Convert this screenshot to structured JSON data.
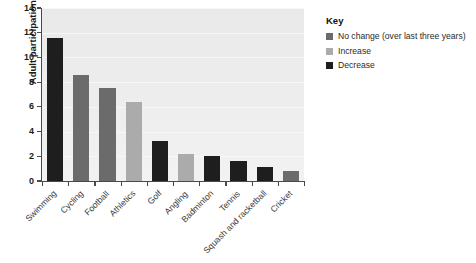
{
  "chart_data": {
    "type": "bar",
    "title": "",
    "xlabel": "",
    "ylabel": "Adult participation per month (%)",
    "ylim": [
      0,
      14
    ],
    "yticks": [
      0,
      2,
      4,
      6,
      8,
      10,
      12,
      14
    ],
    "grid": true,
    "legend_position": "right",
    "categories": [
      "Swimming",
      "Cycling",
      "Football",
      "Athletics",
      "Golf",
      "Angling",
      "Badminton",
      "Tennis",
      "Squash and racketball",
      "Cricket"
    ],
    "values": [
      11.6,
      8.6,
      7.5,
      6.4,
      3.2,
      2.2,
      2.0,
      1.6,
      1.1,
      0.85
    ],
    "point_categories": [
      "Decrease",
      "No change",
      "No change",
      "Increase",
      "Decrease",
      "Increase",
      "Decrease",
      "Decrease",
      "Decrease",
      "No change"
    ],
    "series": [
      {
        "name": "Adult participation per month (%)",
        "values": [
          11.6,
          8.6,
          7.5,
          6.4,
          3.2,
          2.2,
          2.0,
          1.6,
          1.1,
          0.85
        ]
      }
    ]
  },
  "legend": {
    "title": "Key",
    "items": [
      {
        "label": "No change (over last three years)",
        "color": "#6b6b6b",
        "key": "no_change"
      },
      {
        "label": "Increase",
        "color": "#ababab",
        "key": "increase"
      },
      {
        "label": "Decrease",
        "color": "#1e1e1e",
        "key": "decrease"
      }
    ]
  },
  "colors": {
    "no_change": "#6b6b6b",
    "increase": "#ababab",
    "decrease": "#1e1e1e",
    "plot_background": "#ebebeb",
    "axis": "#4a4a4a",
    "text": "#1b1b1b",
    "page_background": "#ffffff"
  }
}
